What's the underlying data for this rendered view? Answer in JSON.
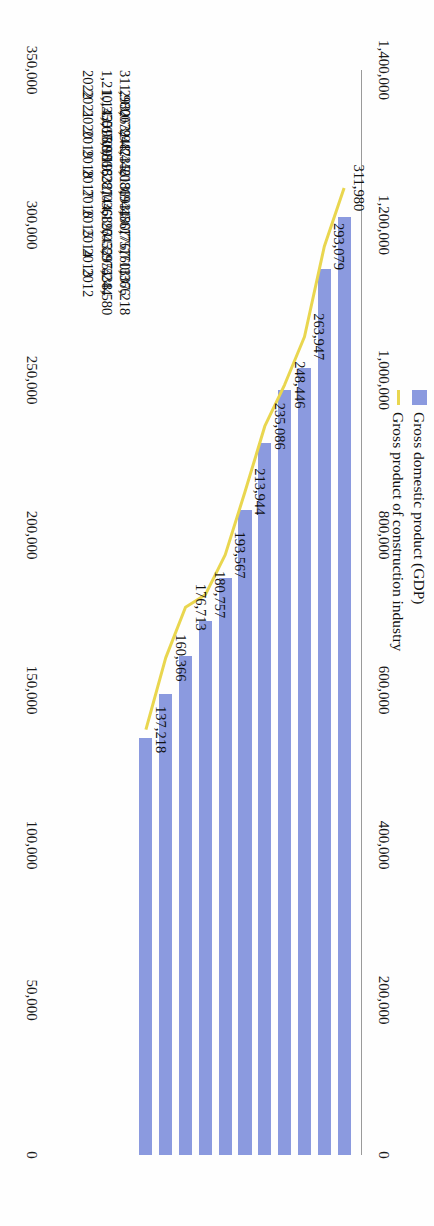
{
  "legend": {
    "items": [
      {
        "label": "Gross domestic product (GDP)",
        "marker": "bar-swatch",
        "color": "#8b9adf"
      },
      {
        "label": "Gross product of construction industry",
        "marker": "line-swatch",
        "color": "#e9d64f"
      }
    ]
  },
  "chart_data": {
    "type": "bar",
    "title": "",
    "subtitle": "",
    "xlabel": "",
    "ylabel": "",
    "orientation": "horizontal-rotated",
    "grid": false,
    "legend_position": "top-left",
    "categories": [
      "2012",
      "2013",
      "2014",
      "2015",
      "2016",
      "2017",
      "2018",
      "2019",
      "2020",
      "2021",
      "2022"
    ],
    "series": [
      {
        "name": "Gross domestic product (GDP)",
        "type": "bar",
        "axis": "primary",
        "color": "#8b9adf",
        "values": [
          538580,
          595244,
          643974,
          689052,
          744127,
          832036,
          919281,
          986515,
          1015986,
          1143670,
          1210355
        ],
        "labels": [
          "538,580",
          "595,244",
          "643,974",
          "689,052",
          "744,127",
          "832,036",
          "919,281",
          "986,515",
          "1,015,986",
          "1,143,670",
          "1,210,355"
        ]
      },
      {
        "name": "Gross product of construction industry",
        "type": "line",
        "axis": "secondary",
        "color": "#e9d64f",
        "values": [
          137218,
          160366,
          176713,
          180757,
          193567,
          213944,
          235086,
          248446,
          263947,
          293079,
          311980
        ],
        "labels": [
          "137,218",
          "160,366",
          "176,713",
          "180,757",
          "193,567",
          "213,944",
          "235,086",
          "248,446",
          "263,947",
          "293,079",
          "311,980"
        ]
      }
    ],
    "primary_axis": {
      "name": "Gross domestic product (GDP)",
      "min": 0,
      "max": 1400000,
      "step": 200000,
      "ticks": [
        "0",
        "200,000",
        "400,000",
        "600,000",
        "800,000",
        "1,000,000",
        "1,200,000",
        "1,400,000"
      ],
      "tick_values": [
        0,
        200000,
        400000,
        600000,
        800000,
        1000000,
        1200000,
        1400000
      ]
    },
    "secondary_axis": {
      "name": "Gross product of construction industry",
      "min": 0,
      "max": 350000,
      "step": 50000,
      "ticks": [
        "0",
        "50,000",
        "100,000",
        "150,000",
        "200,000",
        "250,000",
        "300,000",
        "350,000"
      ],
      "tick_values": [
        0,
        50000,
        100000,
        150000,
        200000,
        250000,
        300000,
        350000
      ]
    }
  }
}
